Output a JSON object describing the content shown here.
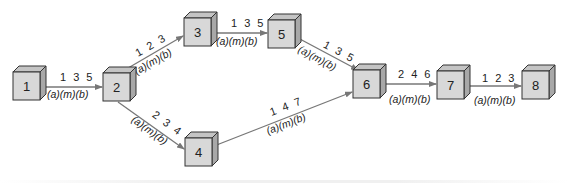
{
  "diagram": {
    "type": "pert-network",
    "colors": {
      "cube_front": "#d8d8d8",
      "cube_top": "#c4c4c4",
      "cube_side": "#a8a8a8",
      "cube_edge": "#333333",
      "arrow": "#777777",
      "text": "#222222"
    },
    "nodes": [
      {
        "id": "1",
        "label": "1",
        "x": 13,
        "y": 72
      },
      {
        "id": "2",
        "label": "2",
        "x": 103,
        "y": 73
      },
      {
        "id": "3",
        "label": "3",
        "x": 184,
        "y": 18
      },
      {
        "id": "5",
        "label": "5",
        "x": 268,
        "y": 20
      },
      {
        "id": "4",
        "label": "4",
        "x": 185,
        "y": 138
      },
      {
        "id": "6",
        "label": "6",
        "x": 353,
        "y": 70
      },
      {
        "id": "7",
        "label": "7",
        "x": 437,
        "y": 71
      },
      {
        "id": "8",
        "label": "8",
        "x": 522,
        "y": 71
      }
    ],
    "edges": [
      {
        "from": "1",
        "to": "2",
        "times": "1 3 5",
        "estimates": "(a)(m)(b)"
      },
      {
        "from": "2",
        "to": "3",
        "times": "1 2 3",
        "estimates": "(a)(m)(b)"
      },
      {
        "from": "2",
        "to": "4",
        "times": "2 3 4",
        "estimates": "(a)(m)(b)"
      },
      {
        "from": "3",
        "to": "5",
        "times": "1 3 5",
        "estimates": "(a)(m)(b)"
      },
      {
        "from": "5",
        "to": "6",
        "times": "1 3 5",
        "estimates": "(a)(m)(b)"
      },
      {
        "from": "4",
        "to": "6",
        "times": "1 4 7",
        "estimates": "(a)(m)(b)"
      },
      {
        "from": "6",
        "to": "7",
        "times": "2 4 6",
        "estimates": "(a)(m)(b)"
      },
      {
        "from": "7",
        "to": "8",
        "times": "1 2 3",
        "estimates": "(a)(m)(b)"
      }
    ]
  }
}
